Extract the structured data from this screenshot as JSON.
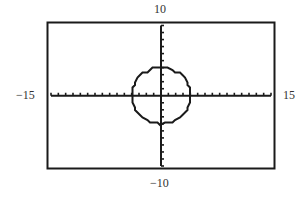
{
  "window": {
    "xmin_label": "−15",
    "xmax_label": "15",
    "ymin_label": "−10",
    "ymax_label": "10"
  },
  "chart_data": {
    "type": "line",
    "title": "",
    "xlabel": "",
    "ylabel": "",
    "xlim": [
      -15,
      15
    ],
    "ylim": [
      -10,
      10
    ],
    "xscl": 1,
    "yscl": 1,
    "grid": false,
    "legend": null,
    "series": [
      {
        "name": "circle",
        "equation": "x^2 + y^2 = 16",
        "center": [
          0,
          0
        ],
        "radius": 4
      }
    ],
    "annotations": [
      "−15",
      "15",
      "−10",
      "10"
    ]
  },
  "colors": {
    "ink": "#1a1a1a",
    "background": "#ffffff"
  }
}
